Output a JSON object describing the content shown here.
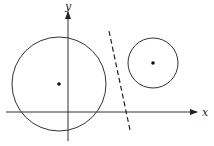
{
  "diagram": {
    "stroke_color": "#333333",
    "axes": {
      "x_label": "x",
      "y_label": "y",
      "origin": [
        68,
        112
      ],
      "x_axis": {
        "x1": 6,
        "x2": 197,
        "y": 112
      },
      "y_axis": {
        "x": 68,
        "y1": 141,
        "y2": 12
      }
    },
    "circles": [
      {
        "name": "large-circle",
        "cx": 59,
        "cy": 84,
        "r": 47,
        "center_dot": true
      },
      {
        "name": "small-circle",
        "cx": 153,
        "cy": 63,
        "r": 25,
        "center_dot": true
      }
    ],
    "separating_line": {
      "style": "dashed",
      "x1": 109,
      "y1": 31,
      "x2": 130,
      "y2": 130
    }
  }
}
